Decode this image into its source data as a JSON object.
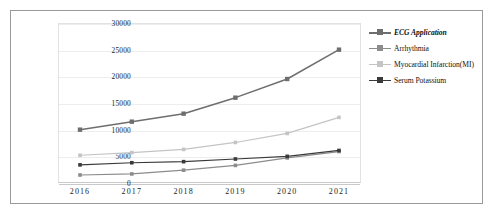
{
  "chart_data": {
    "type": "line",
    "title": "",
    "xlabel": "",
    "ylabel": "",
    "categories": [
      "2016",
      "2017",
      "2018",
      "2019",
      "2020",
      "2021"
    ],
    "ylim": [
      0,
      30000
    ],
    "yticks": [
      "0",
      "5000",
      "10000",
      "15000",
      "20000",
      "25000",
      "30000"
    ],
    "grid": true,
    "legend_position": "right",
    "series": [
      {
        "name": "ECG Application",
        "color": "#6e6e6e",
        "emphasis": true,
        "marker": "square",
        "values": [
          10000,
          11500,
          13000,
          16000,
          19500,
          25000
        ]
      },
      {
        "name": "Arrhythmia",
        "color": "#8c8c8c",
        "emphasis": false,
        "marker": "square",
        "values": [
          1500,
          1700,
          2400,
          3300,
          4700,
          5900
        ]
      },
      {
        "name": "Myocardial Infarction(MI)",
        "color": "#c4c4c4",
        "emphasis": false,
        "marker": "square",
        "values": [
          5200,
          5700,
          6300,
          7600,
          9300,
          12300
        ]
      },
      {
        "name": "Serum Potassium",
        "color": "#3a3a3a",
        "emphasis": false,
        "marker": "square",
        "values": [
          3400,
          3800,
          4000,
          4500,
          5000,
          6100
        ]
      }
    ]
  }
}
